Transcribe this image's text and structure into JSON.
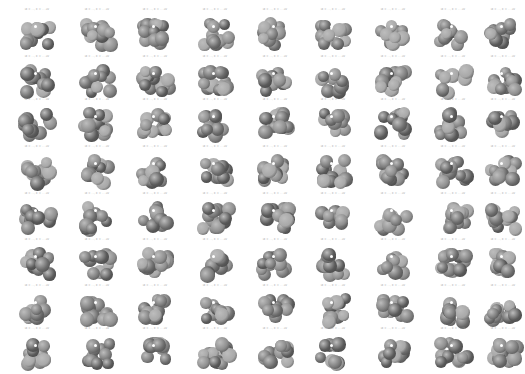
{
  "figure": {
    "rows": 8,
    "cols": 9,
    "caption_pattern": "id = ..., E = ... eV",
    "colors": {
      "background": "#ffffff",
      "atom_dark": "#5a5a5a",
      "atom_mid": "#7c7c7c",
      "atom_light": "#a8a8a8",
      "highlight_atom": "#ffffff",
      "caption_text": "#9a9a9a"
    }
  },
  "cells": []
}
